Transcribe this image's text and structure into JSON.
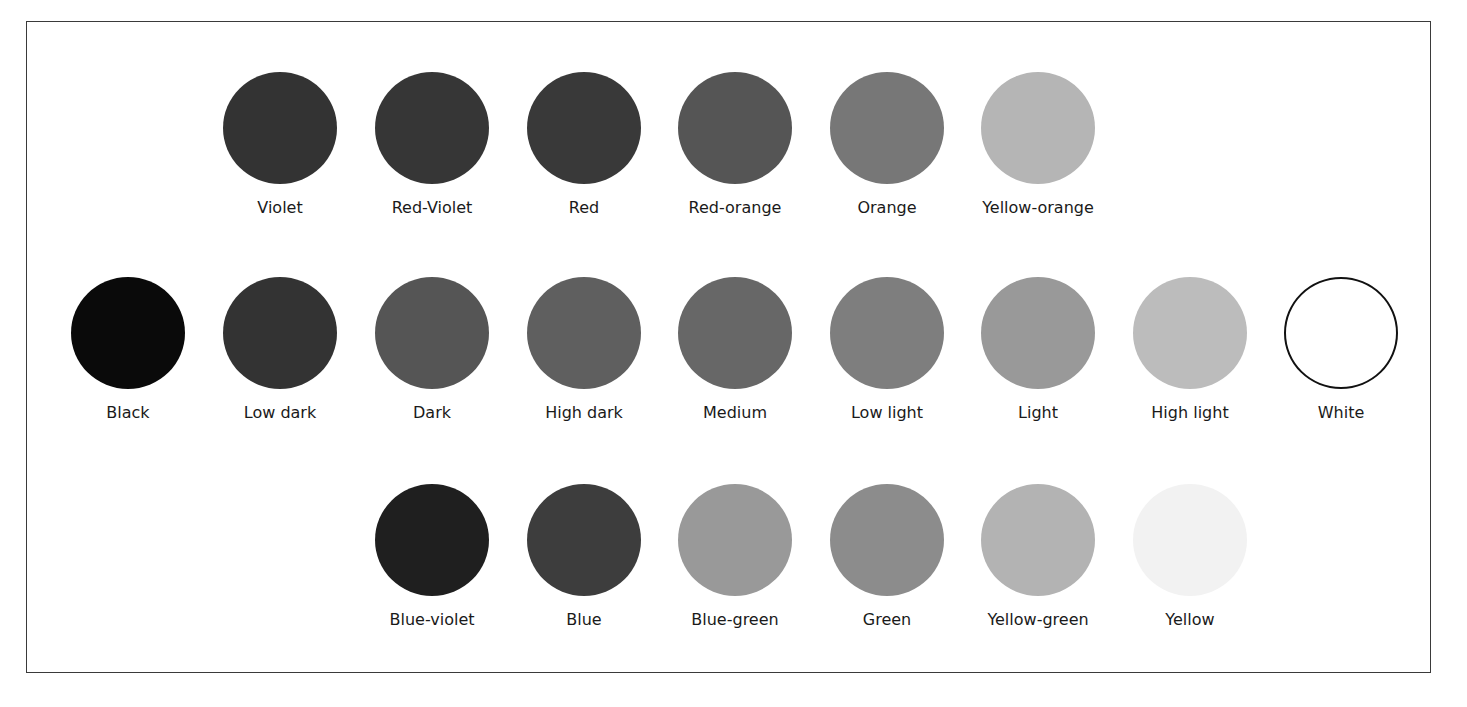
{
  "diagram": {
    "rows": [
      {
        "name": "warm-hues",
        "center_y": 128,
        "items": [
          {
            "label": "Violet",
            "color": "#333333",
            "cx": 280
          },
          {
            "label": "Red-Violet",
            "color": "#363636",
            "cx": 432
          },
          {
            "label": "Red",
            "color": "#393939",
            "cx": 584
          },
          {
            "label": "Red-orange",
            "color": "#555555",
            "cx": 735
          },
          {
            "label": "Orange",
            "color": "#777777",
            "cx": 887
          },
          {
            "label": "Yellow-orange",
            "color": "#b5b5b5",
            "cx": 1038
          }
        ]
      },
      {
        "name": "value-scale",
        "center_y": 333,
        "items": [
          {
            "label": "Black",
            "color": "#0a0a0a",
            "cx": 128
          },
          {
            "label": "Low dark",
            "color": "#333333",
            "cx": 280
          },
          {
            "label": "Dark",
            "color": "#555555",
            "cx": 432
          },
          {
            "label": "High dark",
            "color": "#5f5f5f",
            "cx": 584
          },
          {
            "label": "Medium",
            "color": "#676767",
            "cx": 735
          },
          {
            "label": "Low light",
            "color": "#7e7e7e",
            "cx": 887
          },
          {
            "label": "Light",
            "color": "#999999",
            "cx": 1038
          },
          {
            "label": "High light",
            "color": "#bcbcbc",
            "cx": 1190
          },
          {
            "label": "White",
            "color": "#ffffff",
            "cx": 1341,
            "outlined": true
          }
        ]
      },
      {
        "name": "cool-hues",
        "center_y": 540,
        "items": [
          {
            "label": "Blue-violet",
            "color": "#1f1f1f",
            "cx": 432
          },
          {
            "label": "Blue",
            "color": "#3d3d3d",
            "cx": 584
          },
          {
            "label": "Blue-green",
            "color": "#999999",
            "cx": 735
          },
          {
            "label": "Green",
            "color": "#8c8c8c",
            "cx": 887
          },
          {
            "label": "Yellow-green",
            "color": "#b3b3b3",
            "cx": 1038
          },
          {
            "label": "Yellow",
            "color": "#f2f2f2",
            "cx": 1190
          }
        ]
      }
    ]
  }
}
